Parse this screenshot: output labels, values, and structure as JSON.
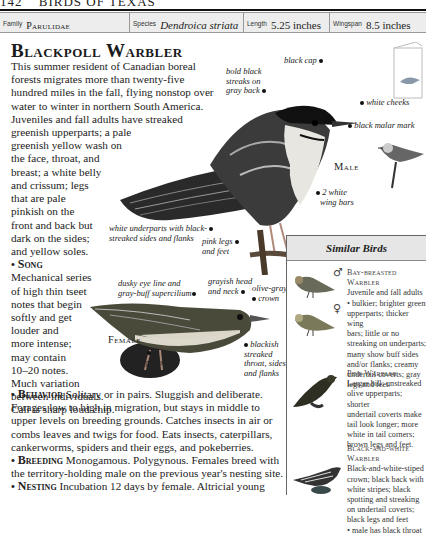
{
  "running_head": {
    "page": "142",
    "title": "BIRDS OF TEXAS"
  },
  "info_bar": {
    "family": {
      "label": "Family",
      "value": "Parulidae"
    },
    "species": {
      "label": "Species",
      "value": "Dendroica striata"
    },
    "length": {
      "label": "Length",
      "value": "5.25 inches"
    },
    "wingspan": {
      "label": "Wingspan",
      "value": "8.5 inches"
    }
  },
  "title": "Blackpoll Warbler",
  "intro": {
    "dropcap": "T",
    "text": "his summer resident of Canadian boreal forests migrates more than twenty-five hundred miles in the fall, flying nonstop over water to winter in northern South America. Juveniles and fall adults have streaked greenish upperparts; a pale greenish yellow wash on the face, throat, and breast; a white belly and crissum; legs that are pale pinkish on the front and back but dark on the sides; and yellow soles."
  },
  "intro_lines": [
    "This summer resident of Canadian boreal",
    "forests migrates more than twenty-five",
    "hundred miles in the fall, flying nonstop over",
    "water to winter in northern South America.",
    "Juveniles and fall adults have streaked",
    "greenish upperparts; a pale",
    "greenish yellow wash on",
    "the face, throat, and",
    "breast; a white belly"
  ],
  "narrow_lines": [
    "and crissum; legs",
    "that are pale",
    "pinkish on the",
    "front and back but",
    "dark on the sides;",
    "and yellow soles."
  ],
  "song": {
    "heading": "Song",
    "lines": [
      "Mechanical series",
      "of high thin tseet",
      "notes that begin",
      "softly and get",
      "louder and",
      "more intense;",
      "may contain",
      "10–20 notes.",
      "Much variation",
      "between individuals.",
      "Call is sharp loud chip."
    ]
  },
  "sections": [
    {
      "heading": "Behavior",
      "text": "Solitary or in pairs. Sluggish and deliberate. Forages low to high in migration, but stays in middle to upper levels on breeding grounds. Catches insects in air or combs leaves and twigs for food. Eats insects, caterpillars, cankerworms, spiders and their eggs, and pokeberries."
    },
    {
      "heading": "Breeding",
      "text": "Monogamous. Polygynous. Females breed with the territory-holding male on the previous year's nesting site."
    },
    {
      "heading": "Nesting",
      "text": "Incubation 12 days by female. Altricial young"
    }
  ],
  "male_labels": {
    "sex": "Male",
    "black_cap": "black cap",
    "bold_streaks": [
      "bold black",
      "streaks on",
      "gray back"
    ],
    "white_cheeks": "white cheeks",
    "malar": "black malar mark",
    "wing_bars": [
      "2 white",
      "wing bars"
    ],
    "underparts": [
      "white underparts with black-",
      "streaked sides and flanks"
    ],
    "legs": [
      "pink legs",
      "and feet"
    ]
  },
  "female_labels": {
    "sex": "Female",
    "eye_line": [
      "dusky eye line and",
      "gray-buff supercilium"
    ],
    "head": [
      "grayish head",
      "and neck"
    ],
    "crown": [
      "olive-gray",
      "crown"
    ],
    "throat": [
      "blackish",
      "streaked",
      "throat, sides,",
      "and flanks"
    ],
    "underparts": [
      "white",
      "underparts"
    ]
  },
  "similar_birds": {
    "header": "Similar Birds",
    "entries": [
      {
        "name": "Bay-breasted Warbler",
        "sex_symbols": [
          "♂",
          "♀"
        ],
        "lines": [
          "Juvenile and fall adults",
          "• bulkier; brighter green",
          "upperparts; thicker wing",
          "bars; little or no",
          "streaking on underparts;",
          "many show buff sides",
          "and/or flanks; creamy",
          "undertail coverts; gray",
          "legs and feet."
        ]
      },
      {
        "name": "Pine Warbler",
        "lines": [
          "Larger bill; unstreaked",
          "olive upperparts; shorter",
          "undertail coverts make",
          "tail look longer; more",
          "white in tail corners;",
          "brown legs and feet."
        ]
      },
      {
        "name": "Black-and-white Warbler",
        "name_lines": [
          "Black-and-white",
          "Warbler"
        ],
        "lines": [
          "Black-and-white-stiped",
          "crown; black back with",
          "white stripes; black",
          "spotting and streaking",
          "on undertail coverts;",
          "black legs and feet",
          "• male has black throat"
        ]
      }
    ]
  }
}
